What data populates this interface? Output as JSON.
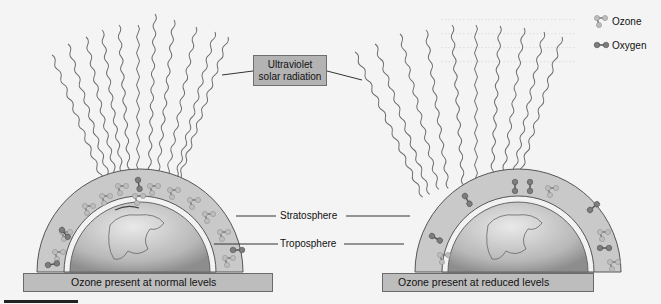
{
  "diagram": {
    "title_box": "Ultraviolet solar radiation",
    "title_lines": [
      "Ultraviolet",
      "solar radiation"
    ],
    "layers": {
      "stratosphere": "Stratosphere",
      "troposphere": "Troposphere"
    },
    "panels": [
      {
        "id": "normal",
        "caption": "Ozone present at normal levels"
      },
      {
        "id": "reduced",
        "caption": "Ozone present at reduced levels"
      }
    ],
    "legend": [
      {
        "icon": "ozone-molecule-icon",
        "label": "Ozone"
      },
      {
        "icon": "oxygen-molecule-icon",
        "label": "Oxygen"
      }
    ]
  },
  "colors": {
    "background": "#f4f4f4",
    "box_fill": "#b3b3b3",
    "stratosphere_fill": "#c8c8c8",
    "molecule_dark": "#7a7a7a",
    "molecule_light": "#c4c4c4"
  }
}
